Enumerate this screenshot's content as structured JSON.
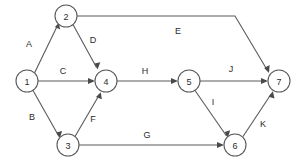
{
  "diagram": {
    "type": "activity-on-arrow-network",
    "canvas": {
      "width": 304,
      "height": 167,
      "background": "#ffffff"
    },
    "style": {
      "line_color": "#5a5a5a",
      "node_fill": "#ffffff",
      "text_color": "#2b2b2b",
      "node_radius": 11
    },
    "nodes": [
      {
        "id": "1",
        "label": "1",
        "cx": 27,
        "cy": 81
      },
      {
        "id": "2",
        "label": "2",
        "cx": 66,
        "cy": 16
      },
      {
        "id": "3",
        "label": "3",
        "cx": 68,
        "cy": 145
      },
      {
        "id": "4",
        "label": "4",
        "cx": 106,
        "cy": 81
      },
      {
        "id": "5",
        "label": "5",
        "cx": 189,
        "cy": 81
      },
      {
        "id": "6",
        "label": "6",
        "cx": 235,
        "cy": 145
      },
      {
        "id": "7",
        "label": "7",
        "cx": 279,
        "cy": 81
      }
    ],
    "edges": [
      {
        "id": "A",
        "label": "A",
        "from": "1",
        "to": "2",
        "label_x": 29,
        "label_y": 44
      },
      {
        "id": "B",
        "label": "B",
        "from": "1",
        "to": "3",
        "label_x": 32,
        "label_y": 117
      },
      {
        "id": "C",
        "label": "C",
        "from": "1",
        "to": "4",
        "label_x": 63,
        "label_y": 71
      },
      {
        "id": "D",
        "label": "D",
        "from": "2",
        "to": "4",
        "label_x": 93,
        "label_y": 40
      },
      {
        "id": "E",
        "label": "E",
        "from": "2",
        "to": "7",
        "label_x": 178,
        "label_y": 31
      },
      {
        "id": "F",
        "label": "F",
        "from": "3",
        "to": "4",
        "label_x": 93,
        "label_y": 119
      },
      {
        "id": "G",
        "label": "G",
        "from": "3",
        "to": "6",
        "label_x": 147,
        "label_y": 135
      },
      {
        "id": "H",
        "label": "H",
        "from": "4",
        "to": "5",
        "label_x": 145,
        "label_y": 71
      },
      {
        "id": "I",
        "label": "I",
        "from": "5",
        "to": "6",
        "label_x": 213,
        "label_y": 102
      },
      {
        "id": "J",
        "label": "J",
        "from": "5",
        "to": "7",
        "label_x": 231,
        "label_y": 69
      },
      {
        "id": "K",
        "label": "K",
        "from": "6",
        "to": "7",
        "label_x": 263,
        "label_y": 124
      }
    ]
  }
}
